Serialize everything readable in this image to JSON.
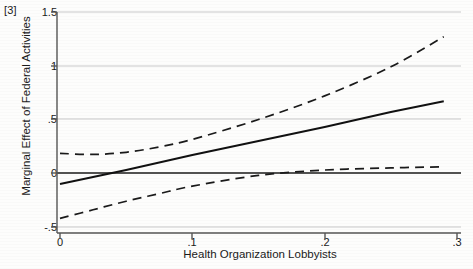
{
  "figure": {
    "panel_label": "[3]",
    "background_color": "#fdfdfc",
    "line_color": "#1a1a1a",
    "grid_color": "#c9c9c9",
    "axis_color": "#555555"
  },
  "chart_data": {
    "type": "line",
    "title": "",
    "subtitle": "",
    "panel_label": "[3]",
    "xlabel": "Health Organization Lobbyists",
    "ylabel": "Marginal Effect of Federal Activities",
    "xlim": [
      0,
      0.3
    ],
    "ylim": [
      -0.5,
      1.5
    ],
    "xticks": [
      0,
      0.1,
      0.2,
      0.3
    ],
    "xtick_labels": [
      "0",
      ".1",
      ".2",
      ".3"
    ],
    "yticks": [
      -0.5,
      0,
      0.5,
      1,
      1.5
    ],
    "ytick_labels": [
      "-.5",
      "0",
      ".5",
      "1",
      "1.5"
    ],
    "grid": "horizontal",
    "legend": "none",
    "zero_reference_line": 0,
    "series": [
      {
        "name": "Marginal effect",
        "style": "solid",
        "x": [
          0.0,
          0.05,
          0.1,
          0.15,
          0.2,
          0.25,
          0.29
        ],
        "values": [
          -0.1,
          0.03,
          0.17,
          0.3,
          0.43,
          0.57,
          0.67
        ]
      },
      {
        "name": "Upper 95% confidence bound",
        "style": "dashed",
        "x": [
          0.0,
          0.025,
          0.05,
          0.075,
          0.1,
          0.15,
          0.2,
          0.25,
          0.29
        ],
        "values": [
          0.185,
          0.175,
          0.195,
          0.245,
          0.315,
          0.5,
          0.72,
          0.99,
          1.27
        ]
      },
      {
        "name": "Lower 95% confidence bound",
        "style": "dashed",
        "x": [
          0.0,
          0.025,
          0.05,
          0.075,
          0.1,
          0.15,
          0.2,
          0.25,
          0.29
        ],
        "values": [
          -0.42,
          -0.34,
          -0.26,
          -0.19,
          -0.12,
          -0.02,
          0.03,
          0.05,
          0.06
        ]
      }
    ]
  }
}
